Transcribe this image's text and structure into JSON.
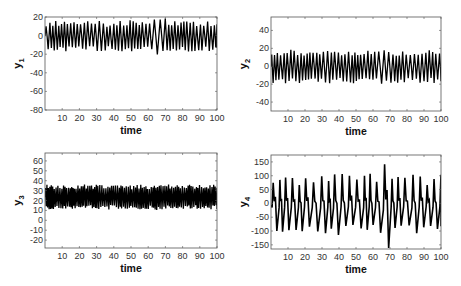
{
  "chart_data": [
    {
      "type": "line",
      "title": "",
      "xlabel": "time",
      "ylabel": "y1",
      "ylabel_main": "y",
      "ylabel_sub": "1",
      "xlim": [
        0,
        100
      ],
      "ylim": [
        -80,
        20
      ],
      "xticks": [
        10,
        20,
        30,
        40,
        50,
        60,
        70,
        80,
        90,
        100
      ],
      "yticks": [
        20,
        0,
        -20,
        -40,
        -60,
        -80
      ],
      "grid": false,
      "legend": null,
      "description": "Chaotic oscillation roughly between -20 and 18, larger excursions around t=62-70",
      "series": [
        {
          "name": "y1",
          "color": "#000000",
          "period": 2.05,
          "high": 16,
          "low": -17,
          "burst": {
            "start": 62,
            "end": 70,
            "high": 21,
            "low": -23
          }
        }
      ],
      "box": {
        "x": 45,
        "y": 17,
        "w": 172,
        "h": 93
      }
    },
    {
      "type": "line",
      "title": "",
      "xlabel": "time",
      "ylabel": "y2",
      "ylabel_main": "y",
      "ylabel_sub": "2",
      "xlim": [
        0,
        100
      ],
      "ylim": [
        -50,
        55
      ],
      "xticks": [
        10,
        20,
        30,
        40,
        50,
        60,
        70,
        80,
        90,
        100
      ],
      "yticks": [
        40,
        20,
        0,
        -20,
        -40
      ],
      "grid": false,
      "legend": null,
      "description": "Chaotic oscillation roughly between -22 and 22",
      "series": [
        {
          "name": "y2",
          "color": "#000000",
          "period": 2.05,
          "high": 18,
          "low": -19,
          "burst": {
            "start": 62,
            "end": 70,
            "high": 20,
            "low": -21
          }
        }
      ],
      "box": {
        "x": 271,
        "y": 17,
        "w": 170,
        "h": 94
      }
    },
    {
      "type": "line",
      "title": "",
      "xlabel": "time",
      "ylabel": "y3",
      "ylabel_main": "y",
      "ylabel_sub": "3",
      "xlim": [
        0,
        100
      ],
      "ylim": [
        -28,
        68
      ],
      "xticks": [
        10,
        20,
        30,
        40,
        50,
        60,
        70,
        80,
        90,
        100
      ],
      "yticks": [
        60,
        50,
        40,
        30,
        20,
        10,
        0,
        -10,
        -20
      ],
      "grid": false,
      "legend": null,
      "description": "Dense chaotic oscillation roughly between 7 and 40",
      "series": [
        {
          "name": "y3",
          "color": "#000000",
          "period": 1.0,
          "high": 36,
          "low": 11,
          "burst": {
            "start": 62,
            "end": 70,
            "high": 37,
            "low": 10
          }
        }
      ],
      "box": {
        "x": 45,
        "y": 153,
        "w": 172,
        "h": 95
      }
    },
    {
      "type": "line",
      "title": "",
      "xlabel": "time",
      "ylabel": "y4",
      "ylabel_main": "y",
      "ylabel_sub": "4",
      "xlim": [
        0,
        100
      ],
      "ylim": [
        -165,
        175
      ],
      "xticks": [
        10,
        20,
        30,
        40,
        50,
        60,
        70,
        80,
        90,
        100
      ],
      "yticks": [
        150,
        100,
        50,
        0,
        -50,
        -100,
        -150
      ],
      "grid": false,
      "legend": null,
      "description": "Spiky chaotic oscillation roughly between -130 and 120, extreme spikes near t=62-70 reaching about ±170",
      "series": [
        {
          "name": "y4",
          "color": "#000000",
          "period": 4.1,
          "high": 105,
          "low": -115,
          "burst": {
            "start": 61,
            "end": 70,
            "high": 170,
            "low": -170
          }
        }
      ],
      "box": {
        "x": 271,
        "y": 155,
        "w": 170,
        "h": 94
      }
    }
  ]
}
